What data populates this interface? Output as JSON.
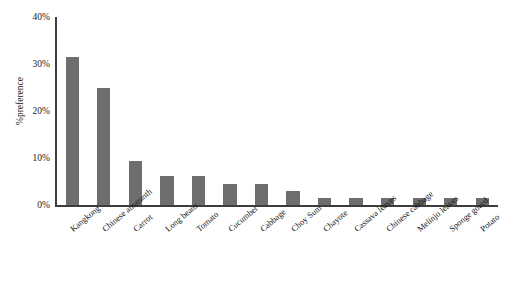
{
  "chart_data": {
    "type": "bar",
    "title": "",
    "xlabel": "",
    "ylabel": "%preference",
    "ylim": [
      0,
      40
    ],
    "ytick_labels": [
      "0%",
      "10%",
      "20%",
      "30%",
      "40%"
    ],
    "ytick_values": [
      0,
      10,
      20,
      30,
      40
    ],
    "grid": false,
    "legend": false,
    "bar_color": "#6e6e6e",
    "axis_color": "#3d3d3d",
    "categories": [
      "Kangkong",
      "Chinese amaranth",
      "Carrot",
      "Long beans",
      "Tomato",
      "Cucumber",
      "Cabbage",
      "Choy Sum",
      "Chayote",
      "Cassava leaves",
      "Chinese cabbage",
      "Melinjo leaves",
      "Sponge gourd",
      "Potato"
    ],
    "values": [
      31.5,
      25.0,
      9.4,
      6.2,
      6.2,
      4.5,
      4.5,
      3.0,
      1.5,
      1.4,
      1.4,
      1.4,
      1.4,
      1.4
    ]
  }
}
